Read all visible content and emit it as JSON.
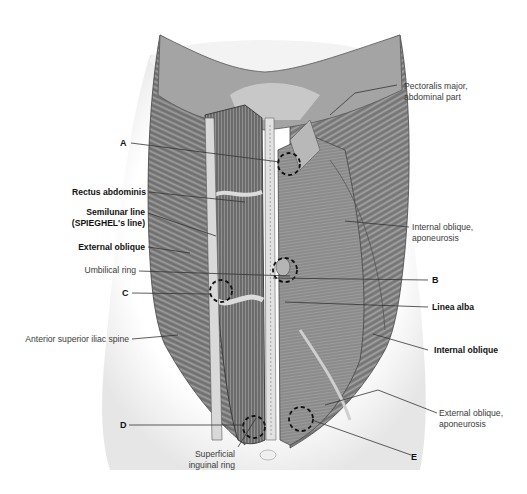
{
  "figure": {
    "colors": {
      "background": "#ffffff",
      "muscle_dark": "#5a5a5a",
      "muscle_mid": "#8c8c8c",
      "muscle_light": "#c8c8c8",
      "skin": "#efefef",
      "leader": "#333333",
      "dashed_circle": "#111111"
    }
  },
  "labels": {
    "pectoralis": {
      "line1": "Pectoralis major,",
      "line2": "abdominal part"
    },
    "a": "A",
    "rectus": "Rectus abdominis",
    "semilunar": {
      "line1": "Semilunar line",
      "line2": "(SPIEGHEL's line)"
    },
    "int_oblique_apo": {
      "line1": "Internal oblique,",
      "line2": "aponeurosis"
    },
    "ext_oblique": "External oblique",
    "umbilical": "Umbilical ring",
    "b": "B",
    "c": "C",
    "linea_alba": "Linea alba",
    "asis": "Anterior superior iliac spine",
    "int_oblique": "Internal oblique",
    "ext_oblique_apo": {
      "line1": "External oblique,",
      "line2": "aponeurosis"
    },
    "d": "D",
    "superficial_ring": {
      "line1": "Superficial",
      "line2": "inguinal ring"
    },
    "e": "E"
  }
}
